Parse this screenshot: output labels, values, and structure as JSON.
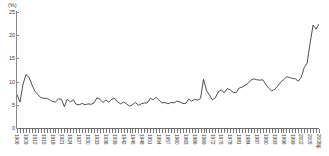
{
  "chart_data": {
    "type": "line",
    "title": "",
    "subtitle": "",
    "xlabel": "",
    "ylabel": "",
    "unit_label": "(%)",
    "ylim": [
      0,
      25
    ],
    "y_ticks": [
      0,
      5,
      10,
      15,
      20,
      25
    ],
    "xlim": [
      1906,
      2008
    ],
    "grid": false,
    "legend": "none",
    "line_color": "#3a3a3a",
    "axis_color": "#8a8a8a",
    "background_color": "#ffffff",
    "x_tick_labels": [
      "1906",
      "1909",
      "1912",
      "1915",
      "1918",
      "1921",
      "1924",
      "1927",
      "1930",
      "1933",
      "1936",
      "1939",
      "1942",
      "1945",
      "1948",
      "1951",
      "1954",
      "1957",
      "1960",
      "1963",
      "1966",
      "1969",
      "1972",
      "1975",
      "1978",
      "1981",
      "1984",
      "1987",
      "1990",
      "1993",
      "1996",
      "1999",
      "2002",
      "2005",
      "2008年"
    ],
    "x_tick_interval_years": 3,
    "x": [
      1906,
      1907,
      1908,
      1909,
      1910,
      1911,
      1912,
      1913,
      1914,
      1915,
      1916,
      1917,
      1918,
      1919,
      1920,
      1921,
      1922,
      1923,
      1924,
      1925,
      1926,
      1927,
      1928,
      1929,
      1930,
      1931,
      1932,
      1933,
      1934,
      1935,
      1936,
      1937,
      1938,
      1939,
      1940,
      1941,
      1942,
      1943,
      1944,
      1945,
      1946,
      1947,
      1948,
      1949,
      1950,
      1951,
      1952,
      1953,
      1954,
      1955,
      1956,
      1957,
      1958,
      1959,
      1960,
      1961,
      1962,
      1963,
      1964,
      1965,
      1966,
      1967,
      1968,
      1969,
      1970,
      1971,
      1972,
      1973,
      1974,
      1975,
      1976,
      1977,
      1978,
      1979,
      1980,
      1981,
      1982,
      1983,
      1984,
      1985,
      1986,
      1987,
      1988,
      1989,
      1990,
      1991,
      1992,
      1993,
      1994,
      1995,
      1996,
      1997,
      1998,
      1999,
      2000,
      2001,
      2002,
      2003,
      2004,
      2005,
      2006,
      2007,
      2008
    ],
    "values": [
      7.2,
      5.6,
      9.3,
      11.5,
      11.0,
      9.4,
      8.0,
      7.2,
      6.6,
      6.4,
      6.4,
      6.1,
      5.7,
      5.6,
      6.3,
      6.2,
      4.6,
      6.2,
      5.6,
      6.1,
      5.1,
      5.0,
      5.3,
      5.0,
      5.2,
      5.1,
      5.4,
      6.5,
      6.2,
      5.5,
      6.0,
      5.6,
      6.2,
      6.4,
      5.6,
      5.2,
      5.6,
      5.2,
      4.7,
      5.0,
      5.5,
      4.9,
      5.2,
      5.4,
      5.4,
      6.4,
      6.1,
      6.6,
      6.0,
      5.4,
      5.5,
      5.2,
      5.5,
      5.4,
      5.8,
      5.6,
      5.3,
      5.3,
      6.2,
      5.8,
      6.2,
      6.0,
      6.4,
      10.5,
      8.1,
      7.1,
      6.1,
      6.5,
      7.8,
      8.2,
      7.6,
      8.5,
      8.2,
      7.7,
      7.6,
      8.6,
      8.8,
      9.2,
      9.6,
      10.3,
      10.6,
      10.4,
      10.3,
      10.4,
      9.4,
      8.6,
      8.0,
      8.3,
      9.0,
      9.8,
      10.4,
      11.0,
      10.9,
      10.7,
      10.6,
      10.1,
      10.9,
      10.0,
      10.1,
      12.1,
      13.0,
      12.6,
      13.5
    ],
    "values_tail_note": "",
    "peak_value": 22.5,
    "min_value": 4.6
  },
  "series_full": {
    "name": "rate",
    "values_extended": [
      7.2,
      5.6,
      9.3,
      11.5,
      11.0,
      9.4,
      8.0,
      7.2,
      6.6,
      6.4,
      6.4,
      6.1,
      5.7,
      5.6,
      6.3,
      6.2,
      4.6,
      6.2,
      5.6,
      6.1,
      5.1,
      5.0,
      5.3,
      5.0,
      5.2,
      5.1,
      5.4,
      6.5,
      6.2,
      5.5,
      6.0,
      5.6,
      6.2,
      6.4,
      5.6,
      5.2,
      5.6,
      5.2,
      4.7,
      5.0,
      5.5,
      4.9,
      5.2,
      5.4,
      5.4,
      6.4,
      6.1,
      6.6,
      6.0,
      5.4,
      5.5,
      5.2,
      5.5,
      5.4,
      5.8,
      5.6,
      5.3,
      5.3,
      6.2,
      5.8,
      6.2,
      6.0,
      6.4,
      10.5,
      8.1,
      7.1,
      6.1,
      6.5,
      7.8,
      8.2,
      7.6,
      8.5,
      8.2,
      7.7,
      7.6,
      8.6,
      8.8,
      9.2,
      9.6,
      10.3,
      10.6,
      10.4,
      10.3,
      10.4,
      9.4,
      8.6,
      8.0,
      8.3,
      9.0,
      9.8,
      10.4,
      11.0,
      10.9,
      10.7,
      10.6,
      10.1,
      10.9,
      10.0,
      10.1,
      12.1,
      13.0,
      12.6,
      13.5
    ]
  }
}
